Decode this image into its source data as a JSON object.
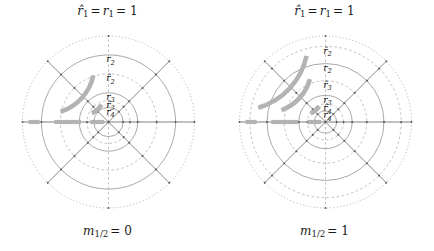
{
  "figure": {
    "background": "#ffffff",
    "width": 434,
    "height": 251,
    "line_color": "#8c8c8c",
    "dashed_color": "#a8a8a8",
    "spoke_color": "#555555",
    "data_color": "#b3b3b3",
    "text_color": "#111111"
  },
  "panels": [
    {
      "id": "left",
      "title": "r̂₁ = r₁ = 1",
      "title_parts": {
        "hat_r": "r̂",
        "sub1": "1",
        "eq1": "=",
        "r": "r",
        "sub2": "1",
        "eq2": "=",
        "value": "1"
      },
      "caption": "m₁∕₂ = 0",
      "caption_parts": {
        "m": "m",
        "sub": "1/2",
        "eq": "=",
        "value": "0"
      },
      "radius_labels": [
        "r₂",
        "r̂₂",
        "r₃",
        "r̂₃",
        "r₄"
      ],
      "radius_label_values": [
        0.78,
        0.56,
        0.34,
        0.25,
        0.17
      ],
      "num_circles": 6,
      "num_spokes": 8,
      "arcs": [
        {
          "radius": 0.57,
          "start_deg": 108,
          "end_deg": 168,
          "label": "outer-arc"
        },
        {
          "radius": 0.22,
          "start_deg": 112,
          "end_deg": 152,
          "label": "inner-arc"
        }
      ],
      "axis_segments": [
        {
          "from": -0.93,
          "to": -0.8
        },
        {
          "from": -0.63,
          "to": -0.32
        },
        {
          "from": -0.21,
          "to": -0.05
        }
      ]
    },
    {
      "id": "right",
      "title": "r̂₁ = r₁ = 1",
      "title_parts": {
        "hat_r": "r̂",
        "sub1": "1",
        "eq1": "=",
        "r": "r",
        "sub2": "1",
        "eq2": "=",
        "value": "1"
      },
      "caption": "m₁∕₂ = 1",
      "caption_parts": {
        "m": "m",
        "sub": "1/2",
        "eq": "=",
        "value": "1"
      },
      "radius_labels": [
        "r̂₂",
        "r₂",
        "r̂₃",
        "r₃",
        "r̂₄",
        "r₄"
      ],
      "radius_label_values": [
        0.88,
        0.68,
        0.48,
        0.31,
        0.21,
        0.13
      ],
      "num_circles": 7,
      "num_spokes": 8,
      "arcs": [
        {
          "radius": 0.8,
          "start_deg": 106,
          "end_deg": 168,
          "label": "outer-arc"
        },
        {
          "radius": 0.53,
          "start_deg": 110,
          "end_deg": 165,
          "label": "middle-arc"
        },
        {
          "radius": 0.2,
          "start_deg": 112,
          "end_deg": 150,
          "label": "inner-arc"
        }
      ],
      "axis_segments": [
        {
          "from": -0.93,
          "to": -0.8
        },
        {
          "from": -0.63,
          "to": -0.32
        },
        {
          "from": -0.21,
          "to": -0.05
        }
      ]
    }
  ],
  "chart_data": {
    "type": "scatter",
    "subtitle": "Two polar plots showing quantised radius rings and highlighted arc data",
    "xlabel": "",
    "ylabel": "",
    "legend": [],
    "grid": true,
    "panels": [
      {
        "name": "m_1/2 = 0",
        "rings": [
          {
            "label": "r̂₁ = r₁ = 1",
            "radius": 1.0,
            "style": "dotted"
          },
          {
            "label": "r₂",
            "radius": 0.78,
            "style": "solid"
          },
          {
            "label": "r̂₂",
            "radius": 0.56,
            "style": "dashed"
          },
          {
            "label": "r₃",
            "radius": 0.34,
            "style": "solid"
          },
          {
            "label": "r̂₃",
            "radius": 0.25,
            "style": "dashed"
          },
          {
            "label": "r₄",
            "radius": 0.17,
            "style": "solid"
          }
        ],
        "spokes_deg": [
          0,
          45,
          90,
          135,
          180,
          225,
          270,
          315
        ],
        "data_arcs": [
          {
            "radius": 0.57,
            "theta_start_deg": 108,
            "theta_end_deg": 168
          },
          {
            "radius": 0.22,
            "theta_start_deg": 112,
            "theta_end_deg": 152
          }
        ],
        "data_axis_segments": [
          [
            -0.93,
            -0.8
          ],
          [
            -0.63,
            -0.32
          ],
          [
            -0.21,
            -0.05
          ]
        ]
      },
      {
        "name": "m_1/2 = 1",
        "rings": [
          {
            "label": "r̂₁ = r₁ = 1",
            "radius": 1.0,
            "style": "dotted"
          },
          {
            "label": "r̂₂",
            "radius": 0.88,
            "style": "dashed"
          },
          {
            "label": "r₂",
            "radius": 0.68,
            "style": "solid"
          },
          {
            "label": "r̂₃",
            "radius": 0.48,
            "style": "dashed"
          },
          {
            "label": "r₃",
            "radius": 0.31,
            "style": "solid"
          },
          {
            "label": "r̂₄",
            "radius": 0.21,
            "style": "dashed"
          },
          {
            "label": "r₄",
            "radius": 0.13,
            "style": "solid"
          }
        ],
        "spokes_deg": [
          0,
          45,
          90,
          135,
          180,
          225,
          270,
          315
        ],
        "data_arcs": [
          {
            "radius": 0.8,
            "theta_start_deg": 106,
            "theta_end_deg": 168
          },
          {
            "radius": 0.53,
            "theta_start_deg": 110,
            "theta_end_deg": 165
          },
          {
            "radius": 0.2,
            "theta_start_deg": 112,
            "theta_end_deg": 150
          }
        ],
        "data_axis_segments": [
          [
            -0.93,
            -0.8
          ],
          [
            -0.63,
            -0.32
          ],
          [
            -0.21,
            -0.05
          ]
        ]
      }
    ]
  }
}
